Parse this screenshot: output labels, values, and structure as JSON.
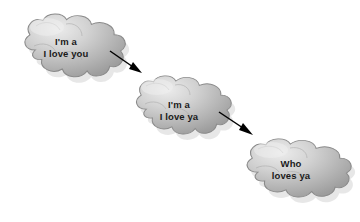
{
  "canvas": {
    "width": 360,
    "height": 222,
    "background_color": "#ffffff"
  },
  "palette": {
    "cloud_highlight": "#e6e6e6",
    "cloud_mid": "#bdbdbd",
    "cloud_shade": "#9a9a9a",
    "cloud_outline": "#7a7a7a",
    "cloud_shadow": "#cfcfcf",
    "arrow_color": "#000000",
    "text_color": "#1a1a1a"
  },
  "diagram": {
    "type": "flow",
    "title": "",
    "nodes": [
      {
        "id": "cloud-1",
        "shape": "cloud",
        "lines": [
          "I'm a",
          "I love you"
        ],
        "text_x": 66,
        "text_y": 36,
        "bbox": {
          "x": 18,
          "y": 12,
          "width": 104,
          "height": 80
        }
      },
      {
        "id": "cloud-2",
        "shape": "cloud",
        "lines": [
          "I'm a",
          "I love ya"
        ],
        "text_x": 179,
        "text_y": 99,
        "bbox": {
          "x": 130,
          "y": 74,
          "width": 100,
          "height": 74
        }
      },
      {
        "id": "cloud-3",
        "shape": "cloud",
        "lines": [
          "Who",
          "loves ya"
        ],
        "text_x": 291,
        "text_y": 158,
        "bbox": {
          "x": 240,
          "y": 137,
          "width": 110,
          "height": 74
        }
      }
    ],
    "arrows": [
      {
        "id": "arrow-1",
        "from": "cloud-1",
        "to": "cloud-2",
        "x1": 110,
        "y1": 51,
        "x2": 141,
        "y2": 73
      },
      {
        "id": "arrow-2",
        "from": "cloud-2",
        "to": "cloud-3",
        "x1": 219,
        "y1": 112,
        "x2": 252,
        "y2": 134
      }
    ]
  }
}
